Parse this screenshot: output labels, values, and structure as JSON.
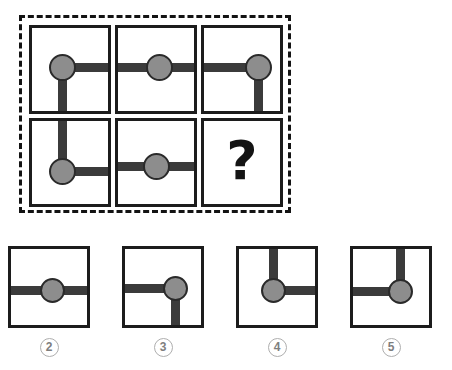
{
  "puzzle": {
    "type": "matrix-reasoning",
    "title": "Figure matrix with missing element",
    "missing_marker": "?",
    "colors": {
      "node_fill": "#8d8d8d",
      "node_stroke": "#2a2a2a",
      "arm": "#3b3b3b",
      "cell_border": "#1c1c1c",
      "dashed_border": "#131313",
      "badge_text": "#7e7e7e",
      "badge_border": "#aeaeae",
      "background": "#ffffff"
    },
    "matrix": {
      "rows": 2,
      "cols": 3,
      "cells": [
        {
          "index": 1,
          "name": "matrix-cell-1",
          "node_x_pct": 37,
          "node_y_pct": 45,
          "arms": [
            "right",
            "down"
          ],
          "description": "circle left of center with arms extending right and down"
        },
        {
          "index": 2,
          "name": "matrix-cell-2",
          "node_x_pct": 50,
          "node_y_pct": 45,
          "arms": [
            "left",
            "right"
          ],
          "description": "circle centered with arms extending left and right"
        },
        {
          "index": 3,
          "name": "matrix-cell-3",
          "node_x_pct": 66,
          "node_y_pct": 45,
          "arms": [
            "left",
            "down"
          ],
          "description": "circle right of center with arms extending left and down"
        },
        {
          "index": 4,
          "name": "matrix-cell-4",
          "node_x_pct": 37,
          "node_y_pct": 58,
          "arms": [
            "up",
            "right"
          ],
          "description": "circle low and left of center with arms extending up and right"
        },
        {
          "index": 5,
          "name": "matrix-cell-5",
          "node_x_pct": 47,
          "node_y_pct": 52,
          "arms": [
            "left",
            "right"
          ],
          "description": "circle centered with arms extending left and right"
        },
        {
          "index": 6,
          "name": "matrix-cell-missing",
          "is_missing": true,
          "label": "?",
          "description": "unknown element shown as a question mark"
        }
      ]
    },
    "options": [
      {
        "label": "2",
        "name": "answer-option-2",
        "node_x_pct": 50,
        "node_y_pct": 50,
        "arms": [
          "left",
          "right"
        ],
        "description": "circle centered with arms extending left and right"
      },
      {
        "label": "3",
        "name": "answer-option-3",
        "node_x_pct": 62,
        "node_y_pct": 48,
        "arms": [
          "left",
          "down"
        ],
        "description": "circle right of center with arms extending left and down"
      },
      {
        "label": "4",
        "name": "answer-option-4",
        "node_x_pct": 42,
        "node_y_pct": 50,
        "arms": [
          "up",
          "right"
        ],
        "description": "circle left of center with arms extending up and right"
      },
      {
        "label": "5",
        "name": "answer-option-5",
        "node_x_pct": 58,
        "node_y_pct": 52,
        "arms": [
          "up",
          "left"
        ],
        "description": "circle right of center with arms extending up and left"
      }
    ],
    "option_positions_px": [
      8,
      122,
      236,
      350
    ]
  }
}
